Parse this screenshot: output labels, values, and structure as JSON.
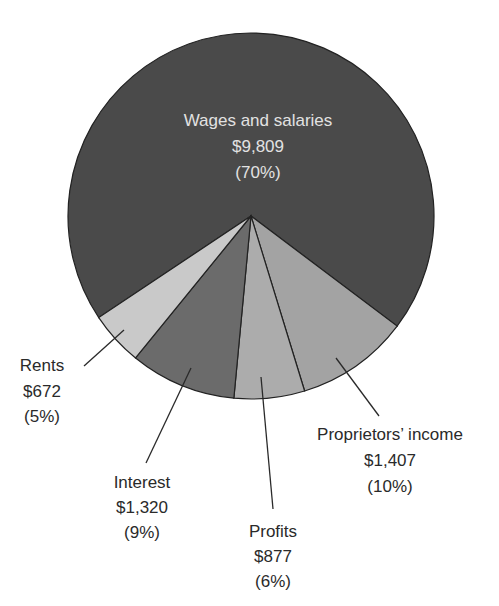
{
  "chart_data": {
    "type": "pie",
    "title": "",
    "unit": "billions of dollars",
    "categories": [
      "Wages and salaries",
      "Proprietors' income",
      "Profits",
      "Interest",
      "Rents"
    ],
    "values": [
      9809,
      1407,
      877,
      1320,
      672
    ],
    "percentages": [
      70,
      10,
      6,
      9,
      5
    ],
    "colors": [
      "#4a4a4a",
      "#a3a3a3",
      "#acacac",
      "#6b6b6b",
      "#c9c9c9"
    ],
    "legend": "none (direct labels)"
  },
  "labels": {
    "wages": {
      "name": "Wages and salaries",
      "amount": "$9,809",
      "pct": "(70%)"
    },
    "proprietors": {
      "name": "Proprietors’ income",
      "amount": "$1,407",
      "pct": "(10%)"
    },
    "profits": {
      "name": "Profits",
      "amount": "$877",
      "pct": "(6%)"
    },
    "interest": {
      "name": "Interest",
      "amount": "$1,320",
      "pct": "(9%)"
    },
    "rents": {
      "name": "Rents",
      "amount": "$672",
      "pct": "(5%)"
    }
  }
}
